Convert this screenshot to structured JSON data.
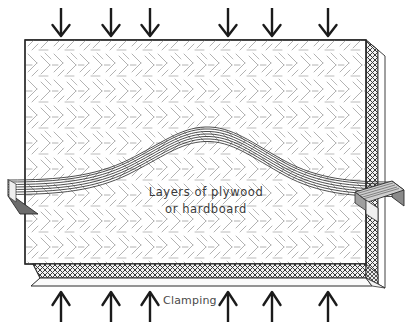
{
  "figure": {
    "background_color": "#ffffff",
    "width": 412,
    "height": 329
  },
  "labels": {
    "material_line1": "Layers of plywood",
    "material_line2": "or hardboard",
    "clamping": "Clamping"
  },
  "colors": {
    "outline": "#2b2b2b",
    "hatch": "#9a9a9a",
    "crosshatch": "#3d3d3d",
    "arrow": "#1b1b1b",
    "text": "#3a3a3a",
    "fill_block": "#ffffff",
    "edge_band": "#d9d9d9"
  },
  "frame": {
    "left": 25,
    "top": 40,
    "right": 366,
    "bottom": 264,
    "depth_offset_x": 12,
    "depth_offset_y": 10
  },
  "arrows": {
    "top_label": "downward clamping force",
    "bottom_label": "upward clamping force",
    "top_positions": [
      61,
      111,
      150,
      228,
      272,
      328
    ],
    "bottom_positions": [
      61,
      111,
      150,
      228,
      272,
      328
    ],
    "top_y_start": 8,
    "top_y_end": 36,
    "bottom_y_start": 322,
    "bottom_y_end": 292,
    "count": 6
  },
  "laminate": {
    "layer_count": 7,
    "description": "curved stack of thin plywood veneers",
    "left_end_x": 8,
    "right_end_x": 392,
    "left_y": 186,
    "right_y": 186,
    "crest_x": 205,
    "crest_y": 128,
    "stack_thickness": 13
  }
}
